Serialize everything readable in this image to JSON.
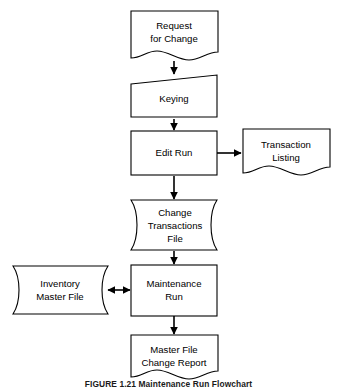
{
  "figure": {
    "caption": "FIGURE 1.21  Maintenance Run Flowchart",
    "background_color": "#ffffff",
    "line_color": "#000000",
    "text_color": "#000000"
  },
  "nodes": {
    "request_for_change": {
      "label_line1": "Request",
      "label_line2": "for Change",
      "symbol": "document"
    },
    "keying": {
      "label_line1": "Keying",
      "symbol": "manual-operation"
    },
    "edit_run": {
      "label_line1": "Edit Run",
      "symbol": "process"
    },
    "transaction_listing": {
      "label_line1": "Transaction",
      "label_line2": "Listing",
      "symbol": "document"
    },
    "change_transactions_file": {
      "label_line1": "Change",
      "label_line2": "Transactions",
      "label_line3": "File",
      "symbol": "magnetic-tape-file"
    },
    "inventory_master_file": {
      "label_line1": "Inventory",
      "label_line2": "Master File",
      "symbol": "magnetic-tape-file"
    },
    "maintenance_run": {
      "label_line1": "Maintenance",
      "label_line2": "Run",
      "symbol": "process"
    },
    "master_file_change_report": {
      "label_line1": "Master File",
      "label_line2": "Change Report",
      "symbol": "document"
    }
  },
  "connectors": [
    {
      "id": "request-to-keying",
      "from": "request_for_change",
      "to": "keying",
      "direction": "down",
      "arrowheads": 1
    },
    {
      "id": "keying-to-edit-run",
      "from": "keying",
      "to": "edit_run",
      "direction": "down",
      "arrowheads": 1
    },
    {
      "id": "edit-run-to-transaction-listing",
      "from": "edit_run",
      "to": "transaction_listing",
      "direction": "right",
      "arrowheads": 1
    },
    {
      "id": "edit-run-to-change-transactions-file",
      "from": "edit_run",
      "to": "change_transactions_file",
      "direction": "down",
      "arrowheads": 1
    },
    {
      "id": "change-transactions-file-to-maintenance-run",
      "from": "change_transactions_file",
      "to": "maintenance_run",
      "direction": "down",
      "arrowheads": 1
    },
    {
      "id": "inventory-master-file-maintenance-run",
      "from": "inventory_master_file",
      "to": "maintenance_run",
      "direction": "bidirectional",
      "arrowheads": 2
    },
    {
      "id": "maintenance-run-to-master-file-change-report",
      "from": "maintenance_run",
      "to": "master_file_change_report",
      "direction": "down",
      "arrowheads": 1
    }
  ]
}
